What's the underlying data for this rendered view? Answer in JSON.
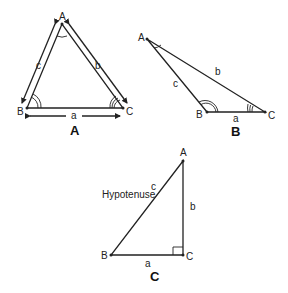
{
  "diagrams": [
    {
      "id": "A",
      "caption": "A",
      "vertices": {
        "A": "A",
        "B": "B",
        "C": "C"
      },
      "sides": {
        "a": "a",
        "b": "b",
        "c": "c"
      },
      "description": "Acute triangle with arrows along each side"
    },
    {
      "id": "B",
      "caption": "B",
      "vertices": {
        "A": "A",
        "B": "B",
        "C": "C"
      },
      "sides": {
        "a": "a",
        "b": "b",
        "c": "c"
      },
      "description": "Obtuse triangle"
    },
    {
      "id": "C",
      "caption": "C",
      "vertices": {
        "A": "A",
        "B": "B",
        "C": "C"
      },
      "sides": {
        "a": "a",
        "b": "b",
        "c": "c"
      },
      "hypotenuse_label": "Hypotenuse",
      "description": "Right triangle with right angle at C"
    }
  ],
  "colors": {
    "line": "#222222",
    "background": "#ffffff"
  }
}
